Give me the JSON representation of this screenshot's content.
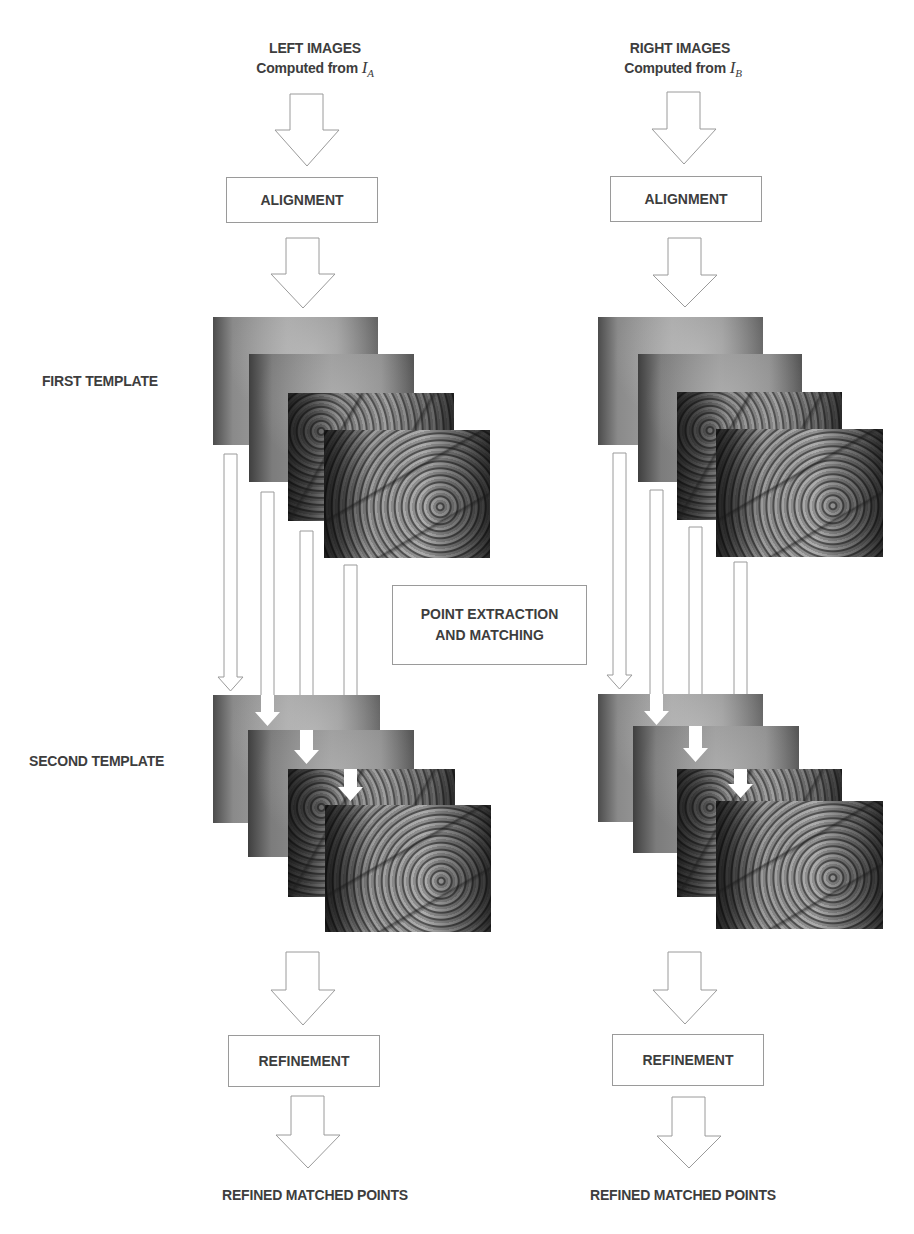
{
  "left_column": {
    "title": "LEFT IMAGES",
    "subtitle_prefix": "Computed from ",
    "subtitle_var": "I",
    "subtitle_sub": "A",
    "alignment_label": "ALIGNMENT",
    "refinement_label": "REFINEMENT",
    "output_label": "REFINED MATCHED POINTS"
  },
  "right_column": {
    "title": "RIGHT IMAGES",
    "subtitle_prefix": "Computed from ",
    "subtitle_var": "I",
    "subtitle_sub": "B",
    "alignment_label": "ALIGNMENT",
    "refinement_label": "REFINEMENT",
    "output_label": "REFINED MATCHED POINTS"
  },
  "row_labels": {
    "first_template": "FIRST TEMPLATE",
    "second_template": "SECOND TEMPLATE"
  },
  "center_box": {
    "line1": "POINT EXTRACTION",
    "line2": "AND MATCHING"
  },
  "image_stacks": {
    "layers_per_stack": 4,
    "layer_types": [
      "smooth",
      "smooth",
      "textured",
      "textured"
    ],
    "content": "grayscale palm/skin texture images"
  },
  "colors": {
    "text": "#3d3d3d",
    "outline": "#9a9a9a",
    "background": "#ffffff"
  }
}
